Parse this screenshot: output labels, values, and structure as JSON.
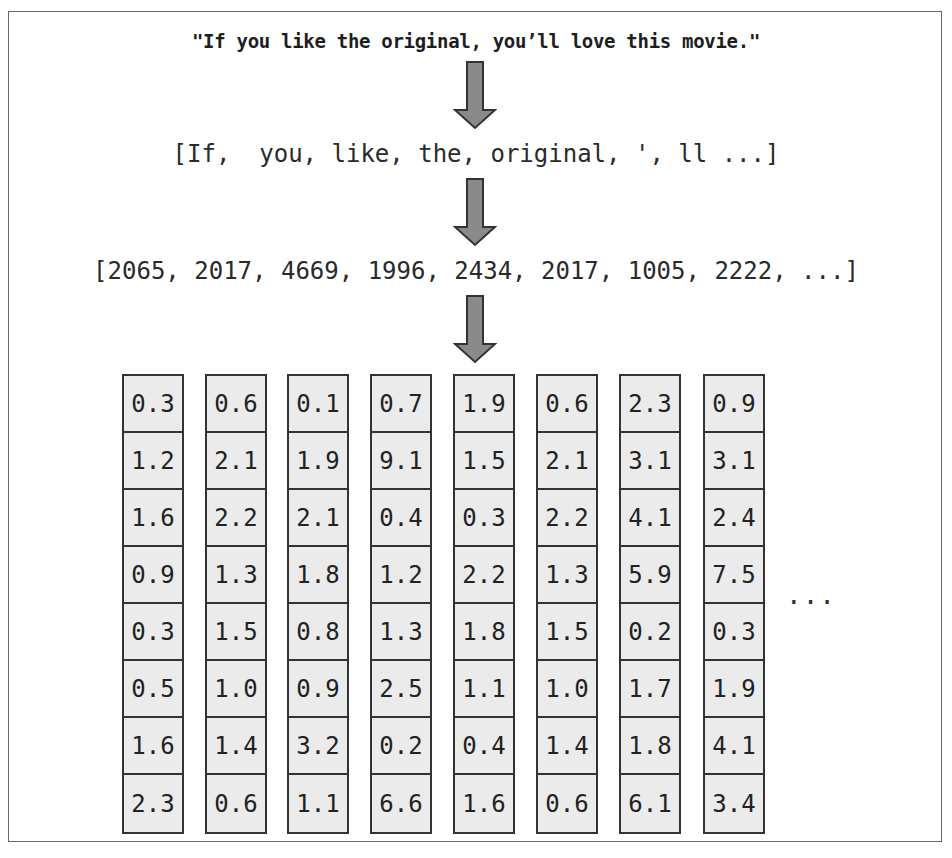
{
  "diagram": {
    "sentence": "\"If you like the original, you’ll love this movie.\"",
    "tokens": "[If,  you, like, the, original, ', ll ...]",
    "token_ids": "[2065, 2017, 4669, 1996, 2434, 2017, 1005, 2222, ...]",
    "embedding_ellipsis": "...",
    "arrow_color": "#8a8a8a",
    "embeddings": [
      [
        "0.3",
        "1.2",
        "1.6",
        "0.9",
        "0.3",
        "0.5",
        "1.6",
        "2.3"
      ],
      [
        "0.6",
        "2.1",
        "2.2",
        "1.3",
        "1.5",
        "1.0",
        "1.4",
        "0.6"
      ],
      [
        "0.1",
        "1.9",
        "2.1",
        "1.8",
        "0.8",
        "0.9",
        "3.2",
        "1.1"
      ],
      [
        "0.7",
        "9.1",
        "0.4",
        "1.2",
        "1.3",
        "2.5",
        "0.2",
        "6.6"
      ],
      [
        "1.9",
        "1.5",
        "0.3",
        "2.2",
        "1.8",
        "1.1",
        "0.4",
        "1.6"
      ],
      [
        "0.6",
        "2.1",
        "2.2",
        "1.3",
        "1.5",
        "1.0",
        "1.4",
        "0.6"
      ],
      [
        "2.3",
        "3.1",
        "4.1",
        "5.9",
        "0.2",
        "1.7",
        "1.8",
        "6.1"
      ],
      [
        "0.9",
        "3.1",
        "2.4",
        "7.5",
        "0.3",
        "1.9",
        "4.1",
        "3.4"
      ]
    ]
  }
}
